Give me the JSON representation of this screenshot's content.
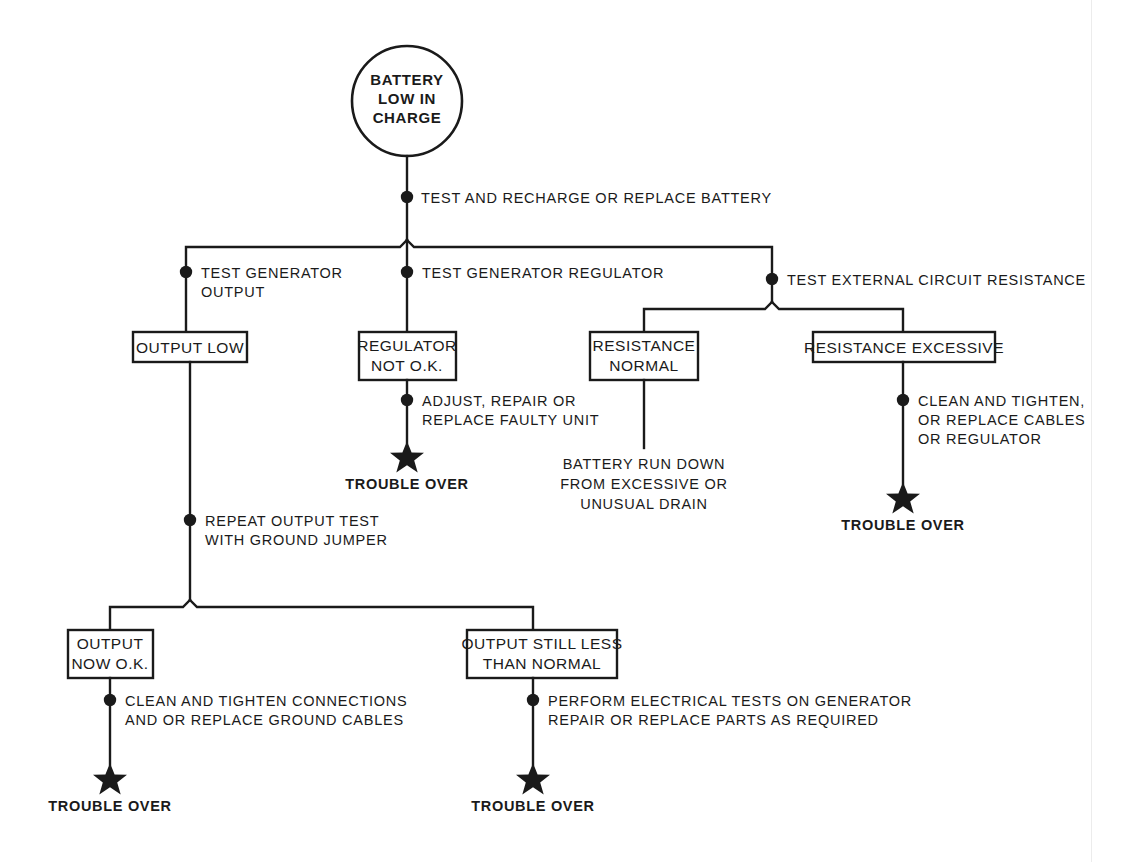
{
  "diagram": {
    "colors": {
      "ink": "#1a1a1a",
      "paper": "#ffffff",
      "page_edge": "#ececec"
    },
    "start_node": {
      "shape": "circle",
      "lines": [
        "BATTERY",
        "LOW  IN",
        "CHARGE"
      ]
    },
    "steps": {
      "recharge": "TEST AND RECHARGE OR REPLACE BATTERY",
      "test_generator_output": [
        "TEST GENERATOR",
        "OUTPUT"
      ],
      "test_generator_regulator": [
        "TEST GENERATOR REGULATOR"
      ],
      "test_external_resistance": [
        "TEST EXTERNAL CIRCUIT RESISTANCE"
      ],
      "adjust_repair": [
        "ADJUST, REPAIR OR",
        "REPLACE FAULTY UNIT"
      ],
      "clean_tighten_cables": [
        "CLEAN AND TIGHTEN,",
        "OR REPLACE CABLES",
        "OR REGULATOR"
      ],
      "repeat_output_test": [
        "REPEAT OUTPUT TEST",
        "WITH GROUND JUMPER"
      ],
      "clean_tighten_connections": [
        "CLEAN AND TIGHTEN CONNECTIONS",
        "AND OR REPLACE GROUND CABLES"
      ],
      "perform_electrical_tests": [
        "PERFORM ELECTRICAL TESTS ON GENERATOR",
        "REPAIR OR REPLACE PARTS AS REQUIRED"
      ]
    },
    "boxes": {
      "output_low": [
        "OUTPUT LOW"
      ],
      "regulator_not_ok": [
        "REGULATOR",
        "NOT O.K."
      ],
      "resistance_normal": [
        "RESISTANCE",
        "NORMAL"
      ],
      "resistance_excessive": [
        "RESISTANCE EXCESSIVE"
      ],
      "output_now_ok": [
        "OUTPUT",
        "NOW O.K."
      ],
      "output_still_less": [
        "OUTPUT STILL LESS",
        "THAN NORMAL"
      ]
    },
    "terminals": {
      "battery_run_down": [
        "BATTERY RUN DOWN",
        "FROM EXCESSIVE OR",
        "UNUSUAL DRAIN"
      ],
      "trouble_over": "TROUBLE OVER"
    }
  }
}
